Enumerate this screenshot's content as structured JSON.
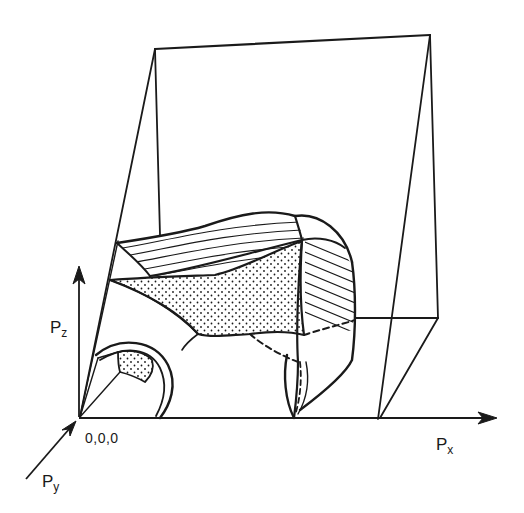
{
  "figure": {
    "ink_color": "#1a1a1a",
    "background": "#ffffff"
  },
  "axes": {
    "x": {
      "main": "P",
      "sub": "x"
    },
    "y": {
      "main": "P",
      "sub": "y"
    },
    "z": {
      "main": "P",
      "sub": "z"
    },
    "origin_label": "0,0,0"
  },
  "regions": {
    "stippled_faces": [
      "central-triangular-face",
      "small-corner-face"
    ],
    "hatched_faces": [
      "top-curved-band",
      "right-curved-band"
    ]
  }
}
